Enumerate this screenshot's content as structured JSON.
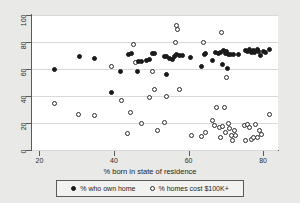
{
  "chart_data": {
    "type": "scatter",
    "title": "",
    "xlabel": "% born in state of residence",
    "ylabel": "",
    "xlim": [
      18,
      84
    ],
    "ylim": [
      0,
      100
    ],
    "xticks": [
      20,
      40,
      60,
      80
    ],
    "yticks": [
      0,
      20,
      40,
      60,
      80,
      100
    ],
    "grid": true,
    "legend_position": "bottom",
    "series": [
      {
        "name": "% who own home",
        "marker": "filled-circle",
        "color": "#1a1a1a",
        "points": [
          [
            24.0,
            59.5
          ],
          [
            30.7,
            69.5
          ],
          [
            34.7,
            67.8
          ],
          [
            39.4,
            42.5
          ],
          [
            41.8,
            58.2
          ],
          [
            44.0,
            70.5
          ],
          [
            44.8,
            71.5
          ],
          [
            46.2,
            58.4
          ],
          [
            46.6,
            65.6
          ],
          [
            47.4,
            65.4
          ],
          [
            48.6,
            66.3
          ],
          [
            49.5,
            67.0
          ],
          [
            50.2,
            71.5
          ],
          [
            50.8,
            71.8
          ],
          [
            53.5,
            69.2
          ],
          [
            54.0,
            69.5
          ],
          [
            54.2,
            56.2
          ],
          [
            55.0,
            68.0
          ],
          [
            55.6,
            67.2
          ],
          [
            56.3,
            69.5
          ],
          [
            56.9,
            70.4
          ],
          [
            57.6,
            70.0
          ],
          [
            58.5,
            70.2
          ],
          [
            60.6,
            68.5
          ],
          [
            63.4,
            62.0
          ],
          [
            64.2,
            70.8
          ],
          [
            64.6,
            71.4
          ],
          [
            66.3,
            66.5
          ],
          [
            67.3,
            72.2
          ],
          [
            68.0,
            71.8
          ],
          [
            68.6,
            72.5
          ],
          [
            69.0,
            63.0
          ],
          [
            69.4,
            73.5
          ],
          [
            69.8,
            71.6
          ],
          [
            70.2,
            72.8
          ],
          [
            70.4,
            60.5
          ],
          [
            70.8,
            71.0
          ],
          [
            71.2,
            70.4
          ],
          [
            72.0,
            70.8
          ],
          [
            73.4,
            71.0
          ],
          [
            75.2,
            73.5
          ],
          [
            75.8,
            73.2
          ],
          [
            76.4,
            74.2
          ],
          [
            76.9,
            72.4
          ],
          [
            77.3,
            73.8
          ],
          [
            77.8,
            72.0
          ],
          [
            78.4,
            74.3
          ],
          [
            78.9,
            72.6
          ],
          [
            79.4,
            69.8
          ],
          [
            80.0,
            73.0
          ],
          [
            80.6,
            72.0
          ],
          [
            81.6,
            74.6
          ]
        ]
      },
      {
        "name": "% homes cost $100K+",
        "marker": "open-circle",
        "color": "#2a2a2a",
        "points": [
          [
            24.1,
            34.6
          ],
          [
            30.6,
            26.0
          ],
          [
            34.7,
            25.8
          ],
          [
            39.3,
            62.0
          ],
          [
            41.9,
            36.8
          ],
          [
            43.5,
            12.2
          ],
          [
            44.5,
            27.5
          ],
          [
            45.3,
            78.5
          ],
          [
            45.8,
            65.0
          ],
          [
            47.4,
            19.5
          ],
          [
            49.6,
            39.0
          ],
          [
            50.4,
            58.0
          ],
          [
            50.9,
            44.8
          ],
          [
            51.6,
            14.2
          ],
          [
            53.6,
            20.5
          ],
          [
            54.2,
            39.6
          ],
          [
            56.4,
            79.5
          ],
          [
            56.8,
            92.0
          ],
          [
            57.0,
            89.6
          ],
          [
            57.5,
            44.6
          ],
          [
            60.8,
            11.0
          ],
          [
            63.5,
            10.0
          ],
          [
            63.9,
            79.5
          ],
          [
            64.5,
            13.0
          ],
          [
            66.4,
            22.0
          ],
          [
            66.9,
            18.4
          ],
          [
            67.5,
            31.4
          ],
          [
            68.2,
            16.8
          ],
          [
            68.5,
            9.0
          ],
          [
            68.9,
            87.0
          ],
          [
            69.2,
            17.5
          ],
          [
            69.6,
            31.5
          ],
          [
            69.9,
            13.2
          ],
          [
            70.3,
            54.0
          ],
          [
            70.6,
            20.0
          ],
          [
            70.9,
            16.2
          ],
          [
            71.4,
            11.0
          ],
          [
            71.8,
            7.0
          ],
          [
            72.2,
            14.4
          ],
          [
            72.6,
            10.8
          ],
          [
            75.0,
            18.0
          ],
          [
            75.4,
            7.0
          ],
          [
            75.9,
            19.0
          ],
          [
            76.4,
            17.0
          ],
          [
            76.8,
            8.0
          ],
          [
            77.4,
            9.0
          ],
          [
            78.0,
            18.6
          ],
          [
            78.5,
            9.2
          ],
          [
            79.1,
            14.2
          ],
          [
            79.6,
            11.5
          ],
          [
            81.8,
            26.0
          ]
        ]
      }
    ]
  },
  "legend": {
    "items": [
      {
        "label": "% who own home",
        "marker": "filled-circle"
      },
      {
        "label": "% homes cost $100K+",
        "marker": "open-circle"
      }
    ]
  },
  "axis": {
    "x_title": "% born in state of residence",
    "x_tick_labels": [
      "20",
      "40",
      "60",
      "80"
    ],
    "y_tick_labels": [
      "0",
      "20",
      "40",
      "60",
      "80",
      "100"
    ]
  }
}
